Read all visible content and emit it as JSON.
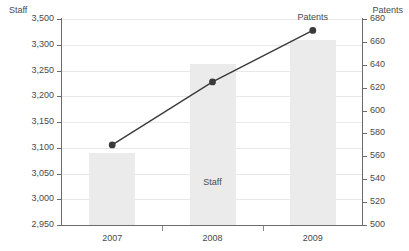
{
  "chart_data": {
    "type": "bar",
    "title": "",
    "subtitle": "",
    "categories": [
      "2007",
      "2008",
      "2009"
    ],
    "xlabel": "",
    "grid": true,
    "legend_position": "inline",
    "series": [
      {
        "name": "Staff",
        "type": "bar",
        "axis": "left",
        "values": [
          3090,
          3262,
          3310
        ],
        "color": "#ebebeb"
      },
      {
        "name": "Patents",
        "type": "line",
        "axis": "right",
        "values": [
          570,
          625,
          670
        ],
        "color": "#3a3a3a"
      }
    ],
    "left_axis": {
      "label": "Staff",
      "ylim": [
        2950,
        3500
      ],
      "ticks": [
        {
          "label": "3,500",
          "value": 3500
        },
        {
          "label": "3,300",
          "value": 3300
        },
        {
          "label": "3,250",
          "value": 3250
        },
        {
          "label": "3,200",
          "value": 3200
        },
        {
          "label": "3,150",
          "value": 3150
        },
        {
          "label": "3,100",
          "value": 3100
        },
        {
          "label": "3,050",
          "value": 3050
        },
        {
          "label": "3,000",
          "value": 3000
        },
        {
          "label": "2,950",
          "value": 2950
        }
      ]
    },
    "right_axis": {
      "label": "Patents",
      "ylim": [
        500,
        680
      ],
      "ticks": [
        {
          "label": "680",
          "value": 680
        },
        {
          "label": "660",
          "value": 660
        },
        {
          "label": "640",
          "value": 640
        },
        {
          "label": "620",
          "value": 620
        },
        {
          "label": "600",
          "value": 600
        },
        {
          "label": "580",
          "value": 580
        },
        {
          "label": "560",
          "value": 560
        },
        {
          "label": "540",
          "value": 540
        },
        {
          "label": "520",
          "value": 520
        },
        {
          "label": "500",
          "value": 500
        }
      ]
    },
    "annotations": [
      {
        "name": "patents-series-label",
        "text": "Patents"
      },
      {
        "name": "staff-series-label",
        "text": "Staff"
      }
    ]
  },
  "axes": {
    "left_title": "Staff",
    "right_title": "Patents"
  },
  "labels": {
    "patents_inline": "Patents",
    "staff_inline": "Staff"
  },
  "colors": {
    "bar": "#ebebeb",
    "line": "#3a3a3a",
    "grid": "#e8e8e8",
    "axis": "#6b6b6b",
    "text": "#4a4a4a"
  }
}
